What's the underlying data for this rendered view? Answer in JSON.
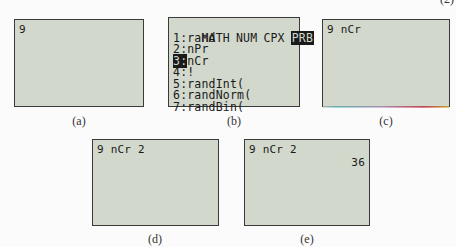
{
  "figure_number": "(2)",
  "panels": {
    "a": {
      "caption": "(a)",
      "lines": [
        "9"
      ]
    },
    "b": {
      "caption": "(b)",
      "menu_tabs": [
        "MATH",
        "NUM",
        "CPX"
      ],
      "menu_tab_selected": "PRB",
      "items": [
        {
          "number": "1",
          "label": "rand"
        },
        {
          "number": "2",
          "label": "nPr"
        },
        {
          "number": "3",
          "label": "nCr",
          "highlighted": true
        },
        {
          "number": "4",
          "label": "!"
        },
        {
          "number": "5",
          "label": "randInt("
        },
        {
          "number": "6",
          "label": "randNorm("
        },
        {
          "number": "7",
          "label": "randBin("
        }
      ]
    },
    "c": {
      "caption": "(c)",
      "lines": [
        "9 nCr"
      ]
    },
    "d": {
      "caption": "(d)",
      "lines": [
        "9 nCr 2"
      ]
    },
    "e": {
      "caption": "(e)",
      "lines": [
        "9 nCr 2"
      ],
      "result": "36"
    }
  },
  "colors": {
    "screen_bg": "#d2d8cc",
    "screen_text": "#1a1a1a",
    "screen_border": "#3a3a3a",
    "page_bg": "#fbfbfb"
  }
}
